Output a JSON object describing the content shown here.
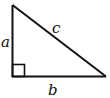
{
  "diagram": {
    "type": "right-triangle",
    "stroke_color": "#111111",
    "background": "#ffffff",
    "vertices": {
      "top": [
        12,
        5
      ],
      "right_angle": [
        12,
        77
      ],
      "right": [
        106,
        77
      ]
    },
    "right_angle_marker": true,
    "labels": {
      "a": "a",
      "b": "b",
      "c": "c"
    },
    "sides": [
      {
        "name": "a",
        "description": "vertical leg"
      },
      {
        "name": "b",
        "description": "horizontal leg"
      },
      {
        "name": "c",
        "description": "hypotenuse"
      }
    ]
  }
}
